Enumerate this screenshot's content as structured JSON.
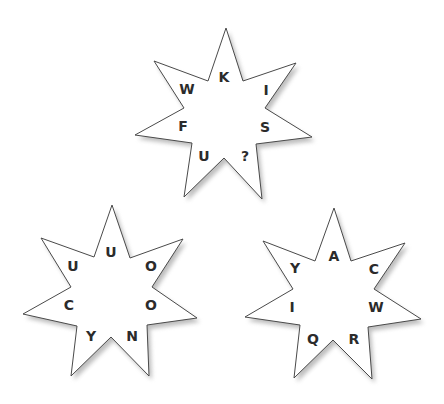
{
  "puzzle": {
    "type": "letter-stars",
    "stars": [
      {
        "id": "top",
        "points": [
          [
            226,
            28
          ],
          [
            243,
            81
          ],
          [
            296,
            63
          ],
          [
            265,
            108
          ],
          [
            312,
            137
          ],
          [
            256,
            144
          ],
          [
            262,
            199
          ],
          [
            224,
            158
          ],
          [
            184,
            197
          ],
          [
            192,
            143
          ],
          [
            135,
            135
          ],
          [
            184,
            108
          ],
          [
            154,
            61
          ],
          [
            208,
            81
          ]
        ],
        "letters": [
          {
            "char": "K",
            "x": 224,
            "y": 77
          },
          {
            "char": "I",
            "x": 266,
            "y": 90
          },
          {
            "char": "S",
            "x": 265,
            "y": 127
          },
          {
            "char": "?",
            "x": 245,
            "y": 156
          },
          {
            "char": "U",
            "x": 204,
            "y": 156
          },
          {
            "char": "F",
            "x": 183,
            "y": 126
          },
          {
            "char": "W",
            "x": 187,
            "y": 89
          }
        ]
      },
      {
        "id": "bottom-left",
        "points": [
          [
            112,
            205
          ],
          [
            130,
            258
          ],
          [
            183,
            239
          ],
          [
            152,
            287
          ],
          [
            197,
            318
          ],
          [
            147,
            325
          ],
          [
            149,
            376
          ],
          [
            111,
            337
          ],
          [
            71,
            376
          ],
          [
            77,
            326
          ],
          [
            23,
            314
          ],
          [
            71,
            287
          ],
          [
            41,
            238
          ],
          [
            94,
            257
          ]
        ],
        "letters": [
          {
            "char": "U",
            "x": 111,
            "y": 252
          },
          {
            "char": "O",
            "x": 151,
            "y": 266
          },
          {
            "char": "O",
            "x": 151,
            "y": 305
          },
          {
            "char": "N",
            "x": 132,
            "y": 336
          },
          {
            "char": "Y",
            "x": 91,
            "y": 336
          },
          {
            "char": "C",
            "x": 69,
            "y": 305
          },
          {
            "char": "U",
            "x": 73,
            "y": 266
          }
        ]
      },
      {
        "id": "bottom-right",
        "points": [
          [
            334,
            208
          ],
          [
            351,
            261
          ],
          [
            405,
            243
          ],
          [
            374,
            289
          ],
          [
            421,
            319
          ],
          [
            368,
            327
          ],
          [
            372,
            379
          ],
          [
            333,
            340
          ],
          [
            294,
            378
          ],
          [
            300,
            325
          ],
          [
            245,
            317
          ],
          [
            293,
            289
          ],
          [
            263,
            241
          ],
          [
            315,
            261
          ]
        ],
        "letters": [
          {
            "char": "A",
            "x": 334,
            "y": 256
          },
          {
            "char": "C",
            "x": 374,
            "y": 269
          },
          {
            "char": "W",
            "x": 376,
            "y": 307
          },
          {
            "char": "R",
            "x": 354,
            "y": 339
          },
          {
            "char": "Q",
            "x": 313,
            "y": 339
          },
          {
            "char": "I",
            "x": 292,
            "y": 307
          },
          {
            "char": "Y",
            "x": 295,
            "y": 268
          }
        ]
      }
    ]
  },
  "colors": {
    "background": "#ffffff",
    "star_fill": "#ffffff",
    "star_stroke": "#4a4a4a",
    "letter": "#2b2b2b",
    "shadow": "#888888"
  }
}
